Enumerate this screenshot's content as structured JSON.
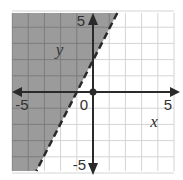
{
  "chart_data": {
    "type": "inequality-graph",
    "inequality": "y > 2x + 2",
    "boundary_line": {
      "slope": 2,
      "intercept": 2,
      "style": "dashed"
    },
    "shaded_side": "left-above",
    "xlim": [
      -5,
      5
    ],
    "ylim": [
      -5,
      5
    ],
    "grid": true,
    "grid_step": 1,
    "xlabel": "x",
    "ylabel": "y",
    "tick_labels": {
      "x_neg": "-5",
      "x_pos": "5",
      "y_pos": "5",
      "y_neg": "-5",
      "origin": "0"
    },
    "origin_point": [
      0,
      0
    ]
  },
  "colors": {
    "shade": "#9b9b9b",
    "grid_in_shade": "#7d7d7d",
    "grid": "#d4d4d4",
    "axis": "#2a2a2a",
    "line": "#2a2a2a"
  },
  "layout": {
    "origin_px": [
      93,
      92
    ],
    "unit_px": 16.2,
    "x_left_px": 12,
    "x_right_px": 174,
    "y_top_px": 13,
    "y_bottom_px": 171
  }
}
